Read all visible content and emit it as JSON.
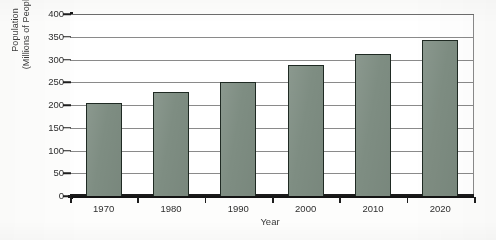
{
  "chart_data": {
    "type": "bar",
    "title": "",
    "xlabel": "Year",
    "ylabel": "Population\n(Millions of People)",
    "ylabel_line1": "Population",
    "ylabel_line2": "(Millions of People)",
    "categories": [
      "1970",
      "1980",
      "1990",
      "2000",
      "2010",
      "2020"
    ],
    "values": [
      205,
      228,
      250,
      288,
      313,
      343
    ],
    "ylim": [
      0,
      400
    ],
    "ytick_values": [
      0,
      50,
      100,
      150,
      200,
      250,
      300,
      350,
      400
    ],
    "ytick_labels": [
      "0",
      "50",
      "100",
      "150",
      "200",
      "250",
      "300",
      "350",
      "400"
    ],
    "grid": "horizontal",
    "legend": "none",
    "bar_color": "#7e8d82",
    "bar_edge_color": "#1f2a23",
    "axis_color": "#141414",
    "gridline_color": "#8a8a8a"
  }
}
